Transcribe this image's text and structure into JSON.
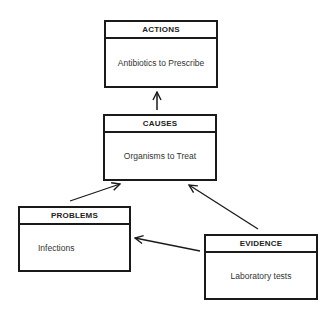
{
  "diagram": {
    "nodes": [
      {
        "id": "actions",
        "title": "ACTIONS",
        "content": "Antibiotics to Prescribe"
      },
      {
        "id": "causes",
        "title": "CAUSES",
        "content": "Organisms to Treat"
      },
      {
        "id": "problems",
        "title": "PROBLEMS",
        "content": "Infections"
      },
      {
        "id": "evidence",
        "title": "EVIDENCE",
        "content": "Laboratory tests"
      }
    ],
    "edges": [
      {
        "from": "causes",
        "to": "actions"
      },
      {
        "from": "problems",
        "to": "causes"
      },
      {
        "from": "evidence",
        "to": "causes"
      },
      {
        "from": "evidence",
        "to": "problems"
      }
    ],
    "colors": {
      "line": "#1a1a1a",
      "background": "#ffffff"
    }
  }
}
